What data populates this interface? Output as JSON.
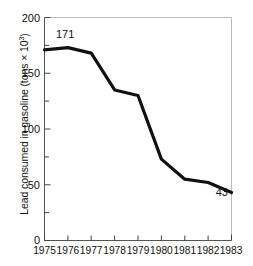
{
  "chart_data": {
    "type": "line",
    "title": "",
    "xlabel": "",
    "ylabel": "Lead consumed in gasoline (tons × 10³)",
    "ylabel_main": "Lead consumed in gasoline (tons × 10",
    "ylabel_sup": "3",
    "ylabel_tail": ")",
    "categories": [
      "1975",
      "1976",
      "1977",
      "1978",
      "1979",
      "1980",
      "1981",
      "1982",
      "1983"
    ],
    "x": [
      1975,
      1976,
      1977,
      1978,
      1979,
      1980,
      1981,
      1982,
      1983
    ],
    "values": [
      171,
      173,
      168,
      135,
      130,
      73,
      55,
      52,
      43
    ],
    "series": [
      {
        "name": "Lead consumed in gasoline",
        "values": [
          171,
          173,
          168,
          135,
          130,
          73,
          55,
          52,
          43
        ]
      }
    ],
    "ylim": [
      0,
      200
    ],
    "xlim": [
      1975,
      1983
    ],
    "yticks": [
      0,
      50,
      100,
      150,
      200
    ],
    "ytick_labels": [
      "0",
      "50",
      "100",
      "150",
      "200"
    ],
    "yticks_minor": [
      25,
      75,
      125,
      175
    ],
    "xticks": [
      1975,
      1976,
      1977,
      1978,
      1979,
      1980,
      1981,
      1982,
      1983
    ],
    "grid": false,
    "legend": false,
    "legend_position": "none",
    "line_color": "#111111",
    "line_width": 3.2,
    "annotations": [
      {
        "label": "171",
        "x": 1975,
        "y": 171,
        "position": "above-right"
      },
      {
        "label": "43",
        "x": 1983,
        "y": 43,
        "position": "above-left"
      }
    ]
  },
  "axes": {
    "ytick_0": "0",
    "ytick_50": "50",
    "ytick_100": "100",
    "ytick_150": "150",
    "ytick_200": "200",
    "year_1975": "1975",
    "year_1976": "1976",
    "year_1977": "1977",
    "year_1978": "1978",
    "year_1979": "1979",
    "year_1980": "1980",
    "year_1981": "1981",
    "year_1982": "1982",
    "year_1983": "1983"
  },
  "annotations": {
    "start_value": "171",
    "end_value": "43"
  },
  "colors": {
    "background": "#ffffff",
    "line": "#111111",
    "axis": "#444444",
    "text": "#111111"
  }
}
